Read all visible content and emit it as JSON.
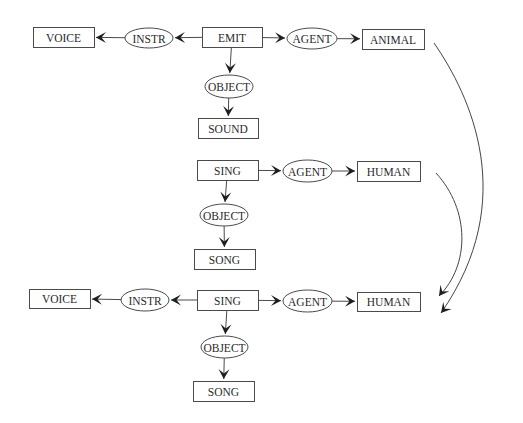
{
  "diagram": {
    "type": "conceptual-graph-derivation",
    "graphs": [
      {
        "name": "graph-emit",
        "nodes": [
          {
            "id": "g1_voice",
            "label": "VOICE",
            "shape": "box"
          },
          {
            "id": "g1_instr",
            "label": "INSTR",
            "shape": "ellipse"
          },
          {
            "id": "g1_emit",
            "label": "EMIT",
            "shape": "box"
          },
          {
            "id": "g1_agent",
            "label": "AGENT",
            "shape": "ellipse"
          },
          {
            "id": "g1_animal",
            "label": "ANIMAL",
            "shape": "box"
          },
          {
            "id": "g1_object",
            "label": "OBJECT",
            "shape": "ellipse"
          },
          {
            "id": "g1_sound",
            "label": "SOUND",
            "shape": "box"
          }
        ],
        "edges": [
          {
            "from": "g1_emit",
            "to": "g1_instr"
          },
          {
            "from": "g1_instr",
            "to": "g1_voice"
          },
          {
            "from": "g1_emit",
            "to": "g1_agent"
          },
          {
            "from": "g1_agent",
            "to": "g1_animal"
          },
          {
            "from": "g1_emit",
            "to": "g1_object"
          },
          {
            "from": "g1_object",
            "to": "g1_sound"
          }
        ]
      },
      {
        "name": "graph-sing",
        "nodes": [
          {
            "id": "g2_sing",
            "label": "SING",
            "shape": "box"
          },
          {
            "id": "g2_agent",
            "label": "AGENT",
            "shape": "ellipse"
          },
          {
            "id": "g2_human",
            "label": "HUMAN",
            "shape": "box"
          },
          {
            "id": "g2_object",
            "label": "OBJECT",
            "shape": "ellipse"
          },
          {
            "id": "g2_song",
            "label": "SONG",
            "shape": "box"
          }
        ],
        "edges": [
          {
            "from": "g2_sing",
            "to": "g2_agent"
          },
          {
            "from": "g2_agent",
            "to": "g2_human"
          },
          {
            "from": "g2_sing",
            "to": "g2_object"
          },
          {
            "from": "g2_object",
            "to": "g2_song"
          }
        ]
      },
      {
        "name": "graph-join",
        "nodes": [
          {
            "id": "g3_voice",
            "label": "VOICE",
            "shape": "box"
          },
          {
            "id": "g3_instr",
            "label": "INSTR",
            "shape": "ellipse"
          },
          {
            "id": "g3_sing",
            "label": "SING",
            "shape": "box"
          },
          {
            "id": "g3_agent",
            "label": "AGENT",
            "shape": "ellipse"
          },
          {
            "id": "g3_human",
            "label": "HUMAN",
            "shape": "box"
          },
          {
            "id": "g3_object",
            "label": "OBJECT",
            "shape": "ellipse"
          },
          {
            "id": "g3_song",
            "label": "SONG",
            "shape": "box"
          }
        ],
        "edges": [
          {
            "from": "g3_sing",
            "to": "g3_instr"
          },
          {
            "from": "g3_instr",
            "to": "g3_voice"
          },
          {
            "from": "g3_sing",
            "to": "g3_agent"
          },
          {
            "from": "g3_agent",
            "to": "g3_human"
          },
          {
            "from": "g3_sing",
            "to": "g3_object"
          },
          {
            "from": "g3_object",
            "to": "g3_song"
          }
        ]
      }
    ],
    "derivation_arrows": [
      {
        "from": "g1_animal",
        "to": "g3_human"
      },
      {
        "from": "g2_human",
        "to": "g3_human"
      }
    ]
  }
}
